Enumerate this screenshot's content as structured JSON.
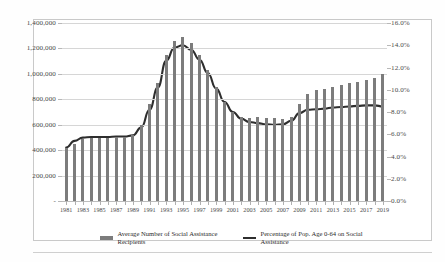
{
  "chart_data": {
    "type": "bar",
    "title": "",
    "subtitle": "",
    "xlabel": "",
    "ylabel": "",
    "grid": true,
    "legend_position": "bottom",
    "x": [
      1981,
      1982,
      1983,
      1984,
      1985,
      1986,
      1987,
      1988,
      1989,
      1990,
      1991,
      1992,
      1993,
      1994,
      1995,
      1996,
      1997,
      1998,
      1999,
      2000,
      2001,
      2002,
      2003,
      2004,
      2005,
      2006,
      2007,
      2008,
      2009,
      2010,
      2011,
      2012,
      2013,
      2014,
      2015,
      2016,
      2017,
      2018,
      2019
    ],
    "tick_labels": [
      "1981",
      "",
      "1983",
      "",
      "1985",
      "",
      "1987",
      "",
      "1989",
      "",
      "1991",
      "",
      "1993",
      "",
      "1995",
      "",
      "1997",
      "",
      "1999",
      "",
      "2001",
      "",
      "2003",
      "",
      "2005",
      "",
      "2007",
      "",
      "2009",
      "",
      "2011",
      "",
      "2013",
      "",
      "2015",
      "",
      "2017",
      "",
      "2019"
    ],
    "left_axis": {
      "label": "",
      "ylim": [
        0,
        1400000
      ],
      "ticks": [
        0,
        200000,
        400000,
        600000,
        800000,
        1000000,
        1200000,
        1400000
      ],
      "tick_labels": [
        "-",
        "200,000",
        "400,000",
        "600,000",
        "800,000",
        "1,000,000",
        "1,200,000",
        "1,400,000"
      ]
    },
    "right_axis": {
      "label": "",
      "ylim": [
        0,
        16
      ],
      "ticks": [
        0,
        2,
        4,
        6,
        8,
        10,
        12,
        14,
        16
      ],
      "tick_labels": [
        "0.0%",
        "2.0%",
        "4.0%",
        "6.0%",
        "8.0%",
        "10.0%",
        "12.0%",
        "14.0%",
        "16.0%"
      ]
    },
    "series": [
      {
        "name": "Average Number of Social Assistance Recipients",
        "type": "bar",
        "axis": "left",
        "color": "#7c7c7c",
        "values": [
          420000,
          450000,
          490000,
          495000,
          495000,
          495000,
          500000,
          500000,
          520000,
          600000,
          760000,
          930000,
          1150000,
          1255000,
          1290000,
          1245000,
          1150000,
          1030000,
          900000,
          780000,
          700000,
          660000,
          655000,
          660000,
          655000,
          650000,
          645000,
          660000,
          760000,
          840000,
          870000,
          880000,
          900000,
          915000,
          930000,
          940000,
          955000,
          970000,
          1000000
        ]
      },
      {
        "name": "Percentage of Pop. Age 0-64 on Social Assistance",
        "type": "line",
        "axis": "right",
        "color": "#2e2e2e",
        "values": [
          4.8,
          5.4,
          5.7,
          5.75,
          5.75,
          5.75,
          5.8,
          5.8,
          5.9,
          6.6,
          8.2,
          10.2,
          12.6,
          13.8,
          14.0,
          13.6,
          12.7,
          11.5,
          10.1,
          8.9,
          8.0,
          7.4,
          7.1,
          7.0,
          6.9,
          6.85,
          6.9,
          7.2,
          7.9,
          8.2,
          8.25,
          8.3,
          8.4,
          8.45,
          8.5,
          8.55,
          8.6,
          8.6,
          8.5
        ]
      }
    ]
  },
  "legend": {
    "items": [
      {
        "label": "Average Number of Social Assistance Recipients",
        "marker": "bar-swatch"
      },
      {
        "label": "Percentage of Pop. Age 0-64 on Social Assistance",
        "marker": "line-swatch"
      }
    ]
  }
}
